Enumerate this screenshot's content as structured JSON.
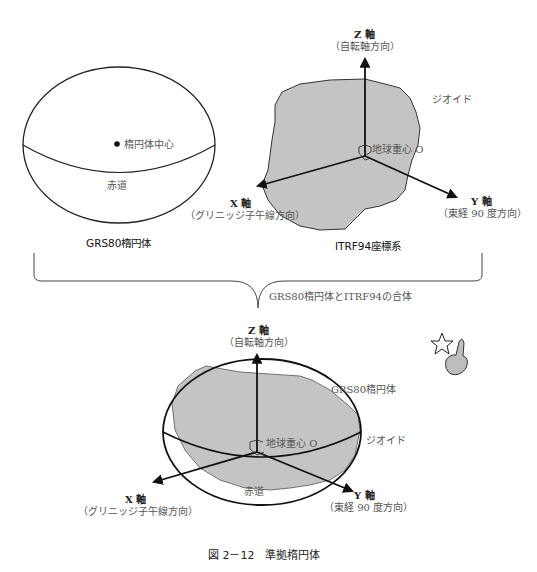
{
  "figure": {
    "caption": "図 2－12　準拠楕円体",
    "colors": {
      "geoid_fill": "#c4c4c4",
      "outline": "#222222",
      "label_text": "#555555"
    }
  },
  "left_panel": {
    "title": "GRS80楕円体",
    "center_label": "楕円体中心",
    "equator_label": "赤道"
  },
  "right_panel": {
    "title": "ITRF94座標系",
    "geoid_label": "ジオイド",
    "origin_label": "地球重心 O",
    "z_axis": {
      "label": "Z 軸",
      "sublabel": "（自転軸方向）"
    },
    "x_axis": {
      "label": "X 軸",
      "sublabel": "（グリニッジ子午線方向）"
    },
    "y_axis": {
      "label": "Y 軸",
      "sublabel": "（東経 90 度方向）"
    }
  },
  "brace": {
    "label": "GRS80楕円体とITRF94の合体"
  },
  "bottom_panel": {
    "ellipsoid_label": "GRS80楕円体",
    "geoid_label": "ジオイド",
    "origin_label": "地球重心 O",
    "equator_label": "赤道",
    "z_axis": {
      "label": "Z 軸",
      "sublabel": "（自転軸方向）"
    },
    "x_axis": {
      "label": "X 軸",
      "sublabel": "（グリニッジ子午線方向）"
    },
    "y_axis": {
      "label": "Y 軸",
      "sublabel": "（東経 90 度方向）"
    }
  },
  "decoration": {
    "icon": "pointing-hand-star-icon"
  }
}
